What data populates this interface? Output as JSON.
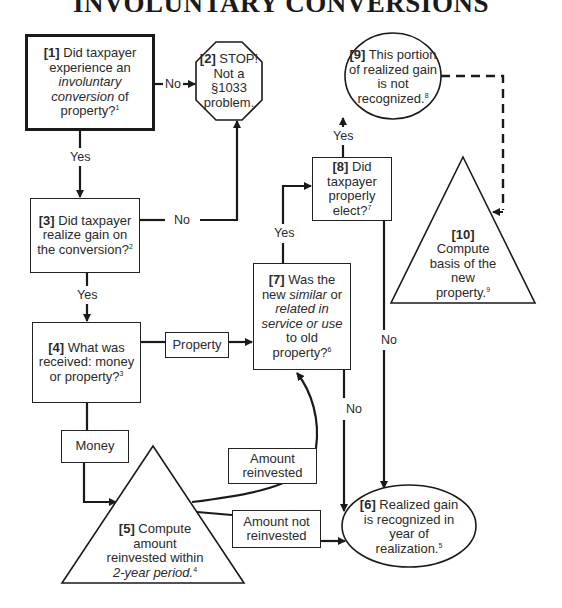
{
  "title": "INVOLUNTARY CONVERSIONS",
  "nodes": {
    "n1": {
      "num": "[1]",
      "line1": " Did taxpayer",
      "line2": "experience an",
      "line3_italic": "involuntary",
      "line4_italic": "conversion",
      "line4_rest": " of",
      "line5": "property?",
      "footnote": "1"
    },
    "n2": {
      "num": "[2]",
      "line1": " STOP!",
      "line2": "Not a",
      "line3": "§1033",
      "line4": "problem."
    },
    "n3": {
      "num": "[3]",
      "line1": " Did taxpayer",
      "line2": "realize gain on",
      "line3": "the conversion?",
      "footnote": "2"
    },
    "n4": {
      "num": "[4]",
      "line1": " What was",
      "line2": "received: money",
      "line3": "or property?",
      "footnote": "3"
    },
    "n5": {
      "num": "[5]",
      "line1": " Compute",
      "line2": "amount",
      "line3": "reinvested within",
      "line4_italic": "2-year period.",
      "footnote": "4"
    },
    "n6": {
      "num": "[6]",
      "line1": " Realized gain",
      "line2": "is recognized in",
      "line3": "year of",
      "line4": "realization.",
      "footnote": "5"
    },
    "n7": {
      "num": "[7]",
      "line1": " Was the",
      "line2a": "new ",
      "line2_italic": "similar",
      "line2b": " or",
      "line3_italic": "related in",
      "line4_italic": "service or use",
      "line5": "to old",
      "line6": "property?",
      "footnote": "6"
    },
    "n8": {
      "num": "[8]",
      "line1": " Did",
      "line2": "taxpayer",
      "line3": "properly",
      "line4": "elect?",
      "footnote": "7"
    },
    "n9": {
      "num": "[9]",
      "line1": " This portion",
      "line2": "of realized gain",
      "line3": "is not",
      "line4": "recognized.",
      "footnote": "8"
    },
    "n10": {
      "num": "[10]",
      "line1": "Compute",
      "line2": "basis of the",
      "line3": "new",
      "line4": "property.",
      "footnote": "9"
    }
  },
  "connector_boxes": {
    "property": "Property",
    "money": "Money",
    "amount_reinvested_l1": "Amount",
    "amount_reinvested_l2": "reinvested",
    "amount_not_reinvested_l1": "Amount not",
    "amount_not_reinvested_l2": "reinvested"
  },
  "edge_labels": {
    "n1_no": "No",
    "n1_yes": "Yes",
    "n3_no": "No",
    "n3_yes": "Yes",
    "n7_yes": "Yes",
    "n7_no": "No",
    "n8_yes": "Yes",
    "n8_no": "No"
  }
}
